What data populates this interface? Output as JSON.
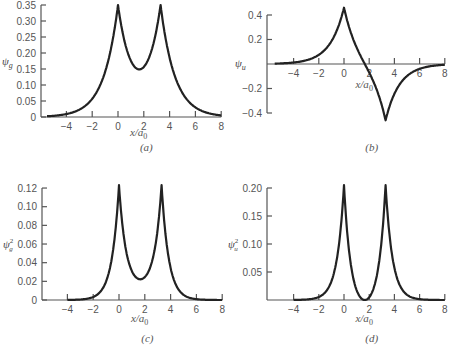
{
  "chart_data": [
    {
      "panel": "a",
      "type": "line",
      "caption": "(a)",
      "ylabel": "ψg",
      "ylabel_main": "ψ",
      "ylabel_sub": "g",
      "ylabel_sup": "",
      "xlabel": "x/a0",
      "xlabel_main": "x/a",
      "xlabel_sub": "0",
      "xticks": [
        -4,
        -2,
        0,
        2,
        4,
        6,
        8
      ],
      "xtick_labels": [
        "−4",
        "−2",
        "0",
        "2",
        "4",
        "6",
        "8"
      ],
      "yticks": [
        0,
        0.05,
        0.1,
        0.15,
        0.2,
        0.25,
        0.3,
        0.35
      ],
      "ytick_labels": [
        "0",
        "0.05",
        "0.10",
        "0.15",
        "0.20",
        "0.25",
        "0.30",
        "0.35"
      ],
      "xlim": [
        -6,
        8
      ],
      "ylim": [
        0,
        0.35
      ],
      "grid": false,
      "x": [
        -5.5,
        -5,
        -4,
        -3,
        -2,
        -1,
        -0.5,
        0,
        0.5,
        1,
        1.65,
        2.3,
        2.8,
        3.3,
        3.8,
        4.3,
        5.3,
        6.3,
        7.3,
        8
      ],
      "y": [
        0.0024,
        0.0037,
        0.0092,
        0.0229,
        0.0568,
        0.141,
        0.2222,
        0.35,
        0.2378,
        0.1755,
        0.1488,
        0.1755,
        0.2378,
        0.35,
        0.2222,
        0.141,
        0.0568,
        0.0229,
        0.0092,
        0.0049
      ]
    },
    {
      "panel": "b",
      "type": "line",
      "caption": "(b)",
      "ylabel": "ψu",
      "ylabel_main": "ψ",
      "ylabel_sub": "u",
      "ylabel_sup": "",
      "xlabel": "x/a0",
      "xlabel_main": "x/a",
      "xlabel_sub": "0",
      "xticks": [
        -4,
        -2,
        0,
        2,
        4,
        6,
        8
      ],
      "xtick_labels": [
        "−4",
        "−2",
        "0",
        "2",
        "4",
        "6",
        "8"
      ],
      "yticks": [
        -0.4,
        -0.2,
        0.2,
        0.4
      ],
      "ytick_labels": [
        "−0.4",
        "−0.2",
        "0.2",
        "0.4"
      ],
      "xlim": [
        -6,
        8
      ],
      "ylim": [
        -0.4,
        0.4
      ],
      "grid": false,
      "x": [
        -5.5,
        -5,
        -4,
        -3,
        -2,
        -1,
        -0.5,
        0,
        0.5,
        1,
        1.65,
        2.3,
        2.8,
        3.3,
        3.8,
        4.3,
        5.3,
        6.3,
        7.3,
        8
      ],
      "y": [
        0.0031,
        0.0049,
        0.0121,
        0.0301,
        0.0746,
        0.1853,
        0.2919,
        0.46,
        0.2692,
        0.1352,
        0,
        -0.1352,
        -0.2692,
        -0.46,
        -0.2919,
        -0.1853,
        -0.0746,
        -0.0301,
        -0.0121,
        -0.0064
      ]
    },
    {
      "panel": "c",
      "type": "line",
      "caption": "(c)",
      "ylabel": "ψg²",
      "ylabel_main": "ψ",
      "ylabel_sub": "g",
      "ylabel_sup": "2",
      "xlabel": "x/a0",
      "xlabel_main": "x/a",
      "xlabel_sub": "0",
      "xticks": [
        -4,
        -2,
        0,
        2,
        4,
        6,
        8
      ],
      "xtick_labels": [
        "−4",
        "−2",
        "0",
        "2",
        "4",
        "6",
        "8"
      ],
      "yticks": [
        0,
        0.02,
        0.04,
        0.06,
        0.08,
        0.1,
        0.12
      ],
      "ytick_labels": [
        "0",
        "0.02",
        "0.04",
        "0.06",
        "0.08",
        "0.10",
        "0.12"
      ],
      "xlim": [
        -6,
        8
      ],
      "ylim": [
        0,
        0.12
      ],
      "grid": false,
      "x": [
        -4,
        -3,
        -2,
        -1,
        -0.5,
        -0.25,
        0,
        0.25,
        0.5,
        1,
        1.65,
        2.3,
        2.8,
        3.05,
        3.3,
        3.55,
        3.8,
        4.3,
        5.3,
        6.3,
        7.3,
        8
      ],
      "y": [
        0.0001,
        0.0005,
        0.0032,
        0.02,
        0.0496,
        0.079,
        0.123,
        0.0818,
        0.0568,
        0.0309,
        0.0222,
        0.0309,
        0.0568,
        0.0818,
        0.123,
        0.079,
        0.0496,
        0.02,
        0.0032,
        0.0005,
        0.0001,
        0.0
      ]
    },
    {
      "panel": "d",
      "type": "line",
      "caption": "(d)",
      "ylabel": "ψu²",
      "ylabel_main": "ψ",
      "ylabel_sub": "u",
      "ylabel_sup": "2",
      "xlabel": "x/a0",
      "xlabel_main": "x/a",
      "xlabel_sub": "0",
      "xticks": [
        -4,
        -2,
        0,
        2,
        4,
        6,
        8
      ],
      "xtick_labels": [
        "−4",
        "−2",
        "0",
        "2",
        "4",
        "6",
        "8"
      ],
      "yticks": [
        0.05,
        0.1,
        0.15,
        0.2
      ],
      "ytick_labels": [
        "0.05",
        "0.10",
        "0.15",
        "0.20"
      ],
      "xlim": [
        -6,
        8
      ],
      "ylim": [
        0,
        0.2
      ],
      "grid": false,
      "x": [
        -4,
        -3,
        -2,
        -1,
        -0.5,
        -0.25,
        0,
        0.25,
        0.5,
        1,
        1.3,
        1.65,
        2.0,
        2.3,
        2.8,
        3.05,
        3.3,
        3.55,
        3.8,
        4.3,
        5.3,
        6.3,
        7.3,
        8
      ],
      "y": [
        0.0001,
        0.0009,
        0.0054,
        0.0333,
        0.0826,
        0.1296,
        0.205,
        0.1233,
        0.0702,
        0.0177,
        0.005,
        0.0,
        0.005,
        0.0177,
        0.0702,
        0.1233,
        0.205,
        0.1296,
        0.0826,
        0.0333,
        0.0054,
        0.0009,
        0.0001,
        0.0
      ]
    }
  ],
  "layout": [
    {
      "yaxis_x": 41,
      "x0_px": 118,
      "px_per_x": 12.9,
      "y0_px": 117,
      "px_per_y": 320,
      "xaxis_from": -5.9,
      "xaxis_to": 8,
      "yaxis_top_val": 0.35,
      "yaxis_bottom_val": 0,
      "caption_y": 151,
      "xlabel_y": 136
    },
    {
      "yaxis_x": 267,
      "x0_px": 344,
      "px_per_x": 12.6,
      "y0_px": 64,
      "px_per_y": 122.5,
      "xaxis_from": -6,
      "xaxis_to": 8,
      "yaxis_top_val": 0.4,
      "yaxis_bottom_val": -0.4,
      "caption_y": 151,
      "xlabel_y": 88
    },
    {
      "yaxis_x": 42,
      "x0_px": 119,
      "px_per_x": 12.9,
      "y0_px": 300,
      "px_per_y": 933,
      "xaxis_from": -6,
      "xaxis_to": 8,
      "yaxis_top_val": 0.12,
      "yaxis_bottom_val": 0,
      "caption_y": 342,
      "xlabel_y": 322
    },
    {
      "yaxis_x": 267,
      "x0_px": 344,
      "px_per_x": 12.6,
      "y0_px": 300,
      "px_per_y": 560,
      "xaxis_from": -6,
      "xaxis_to": 8,
      "yaxis_top_val": 0.2,
      "yaxis_bottom_val": 0,
      "caption_y": 342,
      "xlabel_y": 322
    }
  ]
}
